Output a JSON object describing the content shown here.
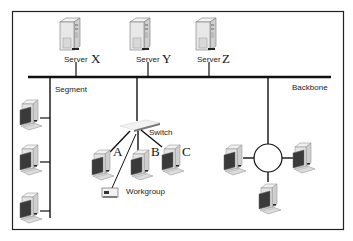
{
  "diagram": {
    "colors": {
      "line": "#111111",
      "frame": "#222222",
      "background": "#ffffff",
      "device_body": "#e6e6e6",
      "screen": "#3a3a3a"
    },
    "servers": [
      {
        "id": "X",
        "label": "Server",
        "letter": "X"
      },
      {
        "id": "Y",
        "label": "Server",
        "letter": "Y"
      },
      {
        "id": "Z",
        "label": "Server",
        "letter": "Z"
      }
    ],
    "labels": {
      "segment": "Segment",
      "backbone": "Backbone",
      "switch": "Switch",
      "workgroup": "Workgroup"
    },
    "workstations": {
      "switched": [
        {
          "letter": "A"
        },
        {
          "letter": "B"
        },
        {
          "letter": "C"
        }
      ],
      "segment_count": 3,
      "ring_count": 3
    }
  }
}
